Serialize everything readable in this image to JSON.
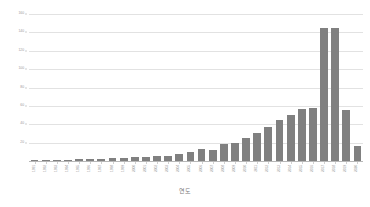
{
  "chart_data": {
    "type": "bar",
    "title": "",
    "subtitle": "",
    "xlabel": "연도",
    "ylabel": "",
    "ylim": [
      0,
      160
    ],
    "ytick_step": 20,
    "yticks": [
      160,
      140,
      120,
      100,
      80,
      60,
      40,
      20
    ],
    "grid": true,
    "legend": false,
    "legend_position": "none",
    "bar_color": "#808080",
    "gridline_color": "#e2e2e2",
    "axis_color": "#b8b8b8",
    "tick_label_color": "#9a9a9a",
    "categories": [
      "1991",
      "1992",
      "1993",
      "1994",
      "1995",
      "1996",
      "1997",
      "1998",
      "1999",
      "2000",
      "2001",
      "2002",
      "2003",
      "2004",
      "2005",
      "2006",
      "2007",
      "2008",
      "2009",
      "2010",
      "2011",
      "2012",
      "2013",
      "2014",
      "2015",
      "2016",
      "2017",
      "2018",
      "2019",
      "2020"
    ],
    "values": [
      1,
      1,
      1,
      1,
      2,
      2,
      2,
      3,
      3,
      4,
      4,
      6,
      6,
      8,
      10,
      13,
      12,
      18,
      20,
      25,
      31,
      37,
      45,
      50,
      57,
      58,
      145,
      145,
      55,
      16
    ],
    "series": [
      {
        "name": "건수",
        "values": [
          1,
          1,
          1,
          1,
          2,
          2,
          2,
          3,
          3,
          4,
          4,
          6,
          6,
          8,
          10,
          13,
          12,
          18,
          20,
          25,
          31,
          37,
          45,
          50,
          57,
          58,
          145,
          145,
          55,
          16
        ]
      }
    ]
  },
  "axis": {
    "x_title": "연도"
  }
}
